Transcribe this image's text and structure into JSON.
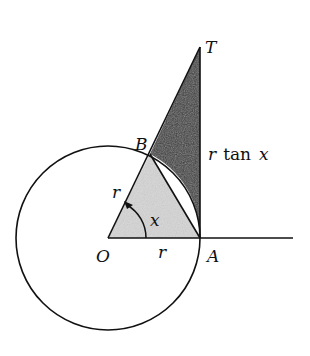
{
  "diagram": {
    "type": "geometry",
    "points": {
      "O": {
        "label": "O",
        "x": 108,
        "y": 238
      },
      "A": {
        "label": "A",
        "x": 200,
        "y": 238
      },
      "B": {
        "label": "B",
        "x": 150,
        "y": 154
      },
      "T": {
        "label": "T",
        "x": 200,
        "y": 47
      }
    },
    "circle": {
      "cx": 108,
      "cy": 238,
      "r": 92
    },
    "labels": {
      "O": "O",
      "A": "A",
      "B": "B",
      "T": "T",
      "radius_OB": "r",
      "radius_OA": "r",
      "angle": "x",
      "tangent_r": "r",
      "tangent_tan": "tan",
      "tangent_x": "x"
    },
    "colors": {
      "stroke": "#111111",
      "light_fill": "#d4d4d4",
      "dark_fill": "#3a3a3a",
      "background": "#ffffff"
    }
  }
}
